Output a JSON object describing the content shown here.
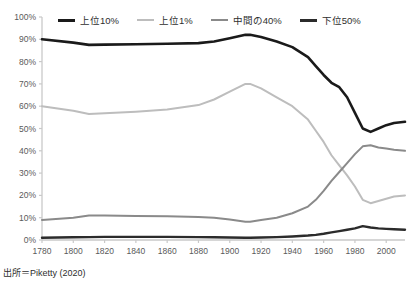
{
  "chart_data": {
    "type": "line",
    "title": "",
    "subtitle": "",
    "xlabel": "",
    "ylabel": "",
    "xlim": [
      1780,
      2012
    ],
    "ylim": [
      0,
      100
    ],
    "grid": false,
    "legend_position": "top",
    "x_ticks": [
      1780,
      1800,
      1820,
      1840,
      1860,
      1880,
      1900,
      1920,
      1940,
      1960,
      1980,
      2000
    ],
    "x_tick_labels": [
      "1780",
      "1800",
      "1820",
      "1840",
      "1860",
      "1880",
      "1900",
      "1920",
      "1940",
      "1960",
      "1980",
      "2000"
    ],
    "y_ticks": [
      0,
      10,
      20,
      30,
      40,
      50,
      60,
      70,
      80,
      90,
      100
    ],
    "y_tick_labels": [
      "0%",
      "10%",
      "20%",
      "30%",
      "40%",
      "50%",
      "60%",
      "70%",
      "80%",
      "90%",
      "100%"
    ],
    "series": [
      {
        "name": "上位10%",
        "color": "#1a1a1a",
        "width": 2.6,
        "x": [
          1780,
          1800,
          1810,
          1820,
          1840,
          1860,
          1880,
          1890,
          1900,
          1910,
          1913,
          1920,
          1930,
          1940,
          1950,
          1955,
          1960,
          1965,
          1970,
          1975,
          1980,
          1985,
          1990,
          1995,
          2000,
          2005,
          2012
        ],
        "values": [
          90,
          88.5,
          87.5,
          87.6,
          87.8,
          88,
          88.3,
          89,
          90.5,
          92,
          92,
          91,
          89,
          86.5,
          82,
          78,
          74,
          70.5,
          68.5,
          64,
          57,
          50,
          48.5,
          50,
          51.5,
          52.5,
          53
        ]
      },
      {
        "name": "上位1%",
        "color": "#bdbdbd",
        "width": 2.0,
        "x": [
          1780,
          1800,
          1810,
          1820,
          1840,
          1860,
          1880,
          1890,
          1900,
          1910,
          1913,
          1920,
          1930,
          1940,
          1950,
          1955,
          1960,
          1965,
          1970,
          1975,
          1980,
          1985,
          1990,
          1995,
          2000,
          2005,
          2012
        ],
        "values": [
          60,
          58,
          56.5,
          56.8,
          57.5,
          58.5,
          60.5,
          63,
          66.5,
          70,
          70,
          68,
          64,
          60,
          54,
          49,
          44,
          38,
          33.5,
          29,
          24,
          18,
          16.5,
          17.5,
          18.5,
          19.5,
          20
        ]
      },
      {
        "name": "中間の40%",
        "color": "#8a8a8a",
        "width": 2.0,
        "x": [
          1780,
          1800,
          1810,
          1820,
          1840,
          1860,
          1880,
          1890,
          1900,
          1910,
          1913,
          1920,
          1930,
          1940,
          1950,
          1955,
          1960,
          1965,
          1970,
          1975,
          1980,
          1985,
          1990,
          1995,
          2000,
          2005,
          2012
        ],
        "values": [
          9,
          10,
          11,
          11,
          10.8,
          10.6,
          10.3,
          10,
          9.2,
          8.2,
          8.2,
          9,
          10,
          12,
          15,
          18,
          22,
          26.5,
          30.5,
          34.5,
          38.5,
          42,
          42.5,
          41.5,
          41,
          40.5,
          40
        ]
      },
      {
        "name": "下位50%",
        "color": "#2b2b2b",
        "width": 2.4,
        "x": [
          1780,
          1800,
          1810,
          1820,
          1840,
          1860,
          1880,
          1890,
          1900,
          1910,
          1913,
          1920,
          1930,
          1940,
          1950,
          1955,
          1960,
          1965,
          1970,
          1975,
          1980,
          1985,
          1990,
          1995,
          2000,
          2005,
          2012
        ],
        "values": [
          1,
          1.2,
          1.3,
          1.4,
          1.4,
          1.4,
          1.3,
          1.2,
          1.1,
          1,
          1,
          1.1,
          1.3,
          1.6,
          2,
          2.3,
          2.8,
          3.4,
          4,
          4.6,
          5.2,
          6.2,
          5.6,
          5.2,
          5,
          4.8,
          4.6
        ]
      }
    ]
  },
  "legend": {
    "items": [
      {
        "label": "上位10%",
        "swatch": "legend-line-top10"
      },
      {
        "label": "上位1%",
        "swatch": "legend-line-top1"
      },
      {
        "label": "中間の40%",
        "swatch": "legend-line-mid40"
      },
      {
        "label": "下位50%",
        "swatch": "legend-line-bot50"
      }
    ]
  },
  "footer": {
    "source": "出所＝Piketty (2020)"
  }
}
